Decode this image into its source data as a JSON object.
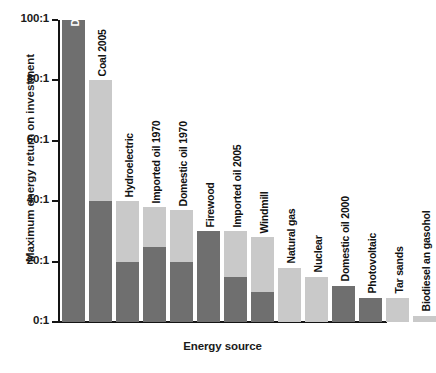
{
  "chart_data": {
    "type": "bar",
    "title": "",
    "xlabel": "Energy source",
    "ylabel": "Maximum energy return on investment",
    "ylim": [
      0,
      100
    ],
    "ytick_labels": [
      "100:1",
      "80:1",
      "60:1",
      "40:1",
      "20:1",
      "0:1"
    ],
    "ytick_values": [
      100,
      80,
      60,
      40,
      20,
      0
    ],
    "grid": false,
    "legend": "none",
    "categories": [
      "Domestic oil 1930",
      "Coal 2005",
      "Hydroelectric",
      "Imported oil 1970",
      "Domestic oil 1970",
      "Firewood",
      "Imported oil 2005",
      "Windmill",
      "Natural gas",
      "Nuclear",
      "Domestic oil 2000",
      "Photovoltaic",
      "Tar sands",
      "Biodiesel an gasohol"
    ],
    "values": [
      100,
      80,
      40,
      38,
      37,
      30,
      30,
      28,
      18,
      15,
      12,
      8,
      8,
      2
    ],
    "series": [
      {
        "name": "lower estimate",
        "values": [
          100,
          40,
          20,
          25,
          20,
          30,
          15,
          10,
          0,
          0,
          12,
          8,
          0,
          0
        ]
      },
      {
        "name": "upper estimate",
        "values": [
          100,
          80,
          40,
          38,
          37,
          30,
          30,
          28,
          18,
          15,
          12,
          8,
          8,
          2
        ]
      }
    ],
    "colors": {
      "dark": "#6f6f6f",
      "light": "#c9c9c9",
      "axis": "#141414",
      "background": "#ffffff"
    }
  }
}
